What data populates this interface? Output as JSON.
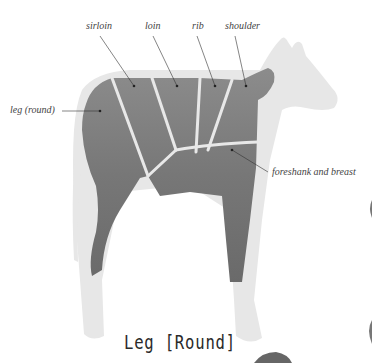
{
  "diagram": {
    "labels": {
      "sirloin": "sirloin",
      "loin": "loin",
      "rib": "rib",
      "shoulder": "shoulder",
      "leg": "leg (round)",
      "foreshank": "foreshank and breast"
    },
    "colors": {
      "body_cut": "#7a7a7a",
      "body_ghost": "#e6e6e6",
      "divider": "#e8e8e8",
      "leader_line": "#333333"
    }
  },
  "section": {
    "title": "Leg [Round]"
  }
}
